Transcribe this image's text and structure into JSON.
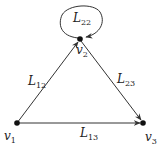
{
  "diagram": {
    "type": "directed-graph",
    "colors": {
      "background": "#ffffff",
      "edge": "#333333",
      "node": "#111111",
      "text": "#222222"
    },
    "nodes": [
      {
        "id": "v1",
        "label": "v",
        "sub": "1",
        "x": 17,
        "y": 123
      },
      {
        "id": "v2",
        "label": "v",
        "sub": "2",
        "x": 80,
        "y": 39
      },
      {
        "id": "v3",
        "label": "v",
        "sub": "3",
        "x": 143,
        "y": 123
      }
    ],
    "edges": [
      {
        "id": "L12",
        "from": "v1",
        "to": "v2",
        "label": "L",
        "sub": "12"
      },
      {
        "id": "L23",
        "from": "v2",
        "to": "v3",
        "label": "L",
        "sub": "23"
      },
      {
        "id": "L13",
        "from": "v1",
        "to": "v3",
        "label": "L",
        "sub": "13"
      },
      {
        "id": "L22",
        "from": "v2",
        "to": "v2",
        "label": "L",
        "sub": "22",
        "self_loop": true
      }
    ]
  }
}
